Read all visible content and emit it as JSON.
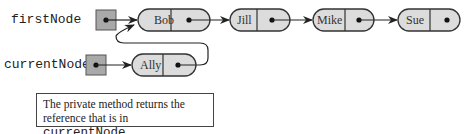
{
  "diagram": {
    "variables": [
      {
        "name": "firstNode",
        "points_to": "Bob"
      },
      {
        "name": "currentNode",
        "points_to": "Ally"
      }
    ],
    "nodes": [
      {
        "data": "Bob",
        "next": "Jill"
      },
      {
        "data": "Jill",
        "next": "Mike"
      },
      {
        "data": "Mike",
        "next": "Sue"
      },
      {
        "data": "Sue",
        "next": null
      },
      {
        "data": "Ally",
        "next": "Bob"
      }
    ],
    "caption": {
      "line1": "The private method returns the",
      "line2_prefix": "reference that is in",
      "line2_code": "currentNode"
    },
    "colors": {
      "node_fill": "#dcdcdc",
      "ref_box_fill": "#a9a9a9",
      "stroke": "#333333"
    }
  }
}
